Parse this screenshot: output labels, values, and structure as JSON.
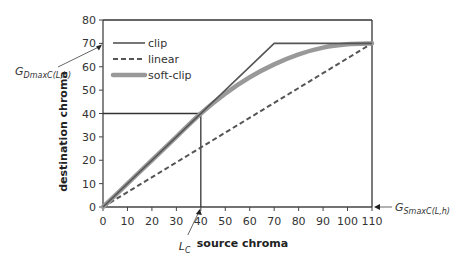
{
  "chart_data": {
    "type": "line",
    "title": "",
    "xlabel": "source chroma",
    "ylabel": "destination chroma",
    "xlim": [
      0,
      110
    ],
    "ylim": [
      0,
      80
    ],
    "xticks": [
      0,
      10,
      20,
      30,
      40,
      50,
      60,
      70,
      80,
      90,
      100,
      110
    ],
    "yticks": [
      0,
      10,
      20,
      30,
      40,
      50,
      60,
      70,
      80
    ],
    "grid": false,
    "legend_position": "top-left",
    "series": [
      {
        "name": "clip",
        "style": "solid",
        "color": "#555555",
        "x": [
          0,
          70,
          110
        ],
        "y": [
          0,
          70,
          70
        ]
      },
      {
        "name": "linear",
        "style": "dashed",
        "color": "#555555",
        "x": [
          0,
          110
        ],
        "y": [
          0,
          70
        ]
      },
      {
        "name": "soft-clip",
        "style": "thick",
        "color": "#999999",
        "x": [
          0,
          10,
          20,
          30,
          40,
          50,
          60,
          70,
          80,
          90,
          100,
          110
        ],
        "y": [
          0,
          10,
          20,
          30,
          40,
          48.5,
          55.5,
          61,
          65.3,
          68.2,
          69.6,
          70
        ]
      }
    ],
    "reference_lines": [
      {
        "name": "Lc-vertical",
        "x": [
          40,
          40
        ],
        "y": [
          0,
          40
        ]
      },
      {
        "name": "Lc-horizontal",
        "x": [
          0,
          40
        ],
        "y": [
          40,
          40
        ]
      },
      {
        "name": "gsmax-vertical",
        "x": [
          110,
          110
        ],
        "y": [
          0,
          80
        ]
      },
      {
        "name": "top-border",
        "x": [
          0,
          110
        ],
        "y": [
          80,
          80
        ]
      }
    ],
    "annotations": [
      {
        "id": "gdmax",
        "text_main": "G",
        "text_sub": "DmaxC(L,h)",
        "points_to": [
          0,
          70
        ]
      },
      {
        "id": "lc",
        "text_main": "L",
        "text_sub": "C",
        "points_to": [
          40,
          0
        ]
      },
      {
        "id": "gsmax",
        "text_main": "G",
        "text_sub": "SmaxC(L,h)",
        "points_to": [
          110,
          0
        ]
      }
    ]
  }
}
